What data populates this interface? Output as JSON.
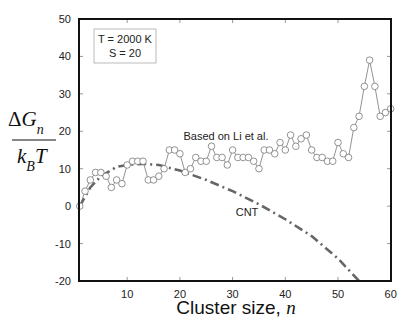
{
  "chart_data": {
    "type": "line",
    "title": "",
    "xlabel": "Cluster size, n",
    "ylabel": "ΔG_n / k_B T",
    "xlim": [
      1,
      60
    ],
    "ylim": [
      -20,
      50
    ],
    "xticks": [
      10,
      20,
      30,
      40,
      50,
      60
    ],
    "yticks": [
      -20,
      -10,
      0,
      10,
      20,
      30,
      40,
      50
    ],
    "legend_box": {
      "line1": "T = 2000 K",
      "line2": "S = 20"
    },
    "annotations": [
      {
        "text": "Based on Li et al.",
        "x": 28,
        "y": 21
      },
      {
        "text": "CNT",
        "x": 34,
        "y": -3
      }
    ],
    "series": [
      {
        "name": "Based on Li et al.",
        "style": "solid thin line with open circle markers",
        "x": [
          1,
          2,
          3,
          4,
          5,
          6,
          7,
          8,
          9,
          10,
          11,
          12,
          13,
          14,
          15,
          16,
          17,
          18,
          19,
          20,
          21,
          22,
          23,
          24,
          25,
          26,
          27,
          28,
          29,
          30,
          31,
          32,
          33,
          34,
          35,
          36,
          37,
          38,
          39,
          40,
          41,
          42,
          43,
          44,
          45,
          46,
          47,
          48,
          49,
          50,
          51,
          52,
          53,
          54,
          55,
          56,
          57,
          58,
          59,
          60
        ],
        "values": [
          0,
          4,
          7,
          9,
          9,
          8,
          5,
          7,
          6,
          11,
          12,
          12,
          12,
          7,
          7,
          8,
          10,
          15,
          15,
          14,
          9,
          10,
          13,
          12,
          12,
          16,
          13,
          13,
          11,
          15,
          13,
          13,
          13,
          12,
          10,
          15,
          15,
          14,
          17,
          15,
          19,
          16,
          18,
          19,
          15,
          13,
          13,
          12,
          12,
          17,
          14,
          13,
          21,
          24,
          32,
          39,
          32,
          24,
          25,
          26
        ]
      },
      {
        "name": "CNT",
        "style": "gray dash-dot line",
        "x": [
          1,
          3,
          5,
          8,
          10,
          13,
          16,
          20,
          25,
          30,
          35,
          40,
          45,
          50,
          54
        ],
        "values": [
          0,
          5,
          8,
          10.5,
          11,
          11.3,
          11,
          9.5,
          7,
          4,
          0.5,
          -3.5,
          -8,
          -14,
          -20
        ]
      }
    ]
  }
}
